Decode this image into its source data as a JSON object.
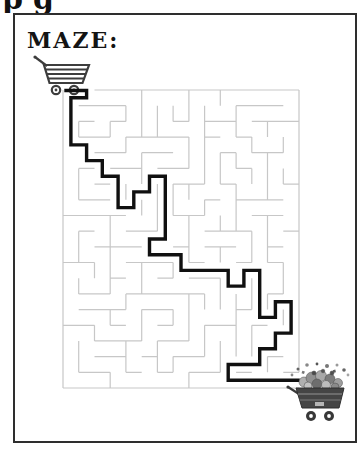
{
  "page": {
    "cropped_heading_fragment": "pg",
    "frame_border_color": "#2e2e2e",
    "background": "#ffffff"
  },
  "title": "MAZE:",
  "maze": {
    "grid": {
      "cols": 15,
      "rows": 19
    },
    "size": {
      "width": 236,
      "height": 298
    },
    "wall_color": "#c7c7c7",
    "wall_width": 1.2,
    "seed": 11,
    "openings": {
      "top_cols": [
        0,
        1
      ],
      "right_rows": [
        18
      ]
    },
    "solution": {
      "color": "#101010",
      "width": 3.4,
      "cells": [
        [
          -0.42,
          -0.47
        ],
        [
          1,
          -0.47
        ],
        [
          1,
          0
        ],
        [
          0,
          0
        ],
        [
          0,
          3
        ],
        [
          1,
          3
        ],
        [
          1,
          4
        ],
        [
          2,
          4
        ],
        [
          2,
          5
        ],
        [
          3,
          5
        ],
        [
          3,
          7
        ],
        [
          4,
          7
        ],
        [
          4,
          6
        ],
        [
          5,
          6
        ],
        [
          5,
          5
        ],
        [
          6,
          5
        ],
        [
          6,
          9
        ],
        [
          5,
          9
        ],
        [
          5,
          10
        ],
        [
          7,
          10
        ],
        [
          7,
          11
        ],
        [
          10,
          11
        ],
        [
          10,
          12
        ],
        [
          11,
          12
        ],
        [
          11,
          11
        ],
        [
          12,
          11
        ],
        [
          12,
          14
        ],
        [
          13,
          14
        ],
        [
          13,
          13
        ],
        [
          14,
          13
        ],
        [
          14,
          15
        ],
        [
          13,
          15
        ],
        [
          13,
          16
        ],
        [
          12,
          16
        ],
        [
          12,
          17
        ],
        [
          10,
          17
        ],
        [
          10,
          18
        ],
        [
          14,
          18
        ],
        [
          14.55,
          18
        ]
      ]
    }
  },
  "icons": {
    "start_cart": "empty-shopping-cart",
    "end_cart": "full-shopping-cart",
    "cart_outline_color": "#3d3d3d"
  }
}
